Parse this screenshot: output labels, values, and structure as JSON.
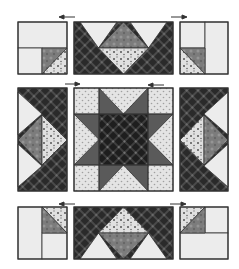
{
  "diagram": {
    "type": "quilt-block-assembly",
    "title": "",
    "layout": "3x3 grid of units assembled into a star block",
    "colors": {
      "light": "#ececec",
      "dark_plaid": "#2a2a2a",
      "dark_plaid_line": "#555555",
      "medium_print": "#7a7a7a",
      "light_print": "#d4d4d4",
      "dotted_light": "#e2e2e2",
      "dot": "#9a9a9a",
      "outline": "#333333",
      "arrow": "#333333"
    },
    "pressing_arrows": [
      {
        "position": "top-left",
        "direction": "left"
      },
      {
        "position": "top-right",
        "direction": "right"
      },
      {
        "position": "middle-left",
        "direction": "right"
      },
      {
        "position": "middle-right",
        "direction": "left"
      },
      {
        "position": "bottom-left",
        "direction": "left"
      },
      {
        "position": "bottom-right",
        "direction": "right"
      }
    ],
    "units": [
      {
        "id": "top-left-corner",
        "kind": "corner unit with half-square triangle"
      },
      {
        "id": "top-flying-geese",
        "kind": "flying geese side unit"
      },
      {
        "id": "top-right-corner",
        "kind": "corner unit with half-square triangle"
      },
      {
        "id": "left-flying-geese",
        "kind": "flying geese side unit (vertical)"
      },
      {
        "id": "center-star",
        "kind": "sawtooth star center block"
      },
      {
        "id": "right-flying-geese",
        "kind": "flying geese side unit (vertical)"
      },
      {
        "id": "bottom-left-corner",
        "kind": "corner unit with half-square triangle"
      },
      {
        "id": "bottom-flying-geese",
        "kind": "flying geese side unit"
      },
      {
        "id": "bottom-right-corner",
        "kind": "corner unit with half-square triangle"
      }
    ]
  }
}
